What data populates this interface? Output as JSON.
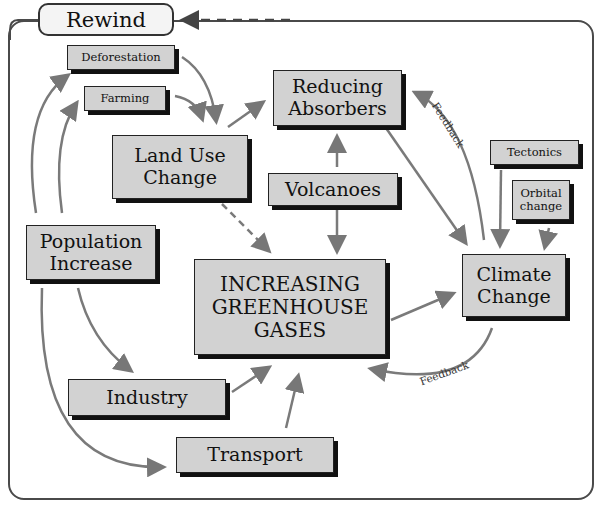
{
  "rewind": {
    "label": "Rewind"
  },
  "nodes": {
    "deforestation": "Deforestation",
    "farming": "Farming",
    "land_use_change": "Land Use\nChange",
    "reducing_absorbers": "Reducing\nAbsorbers",
    "volcanoes": "Volcanoes",
    "tectonics": "Tectonics",
    "orbital_change": "Orbital\nchange",
    "population_increase": "Population\nIncrease",
    "increasing_greenhouse_gases": "INCREASING\nGREENHOUSE\nGASES",
    "climate_change": "Climate\nChange",
    "industry": "Industry",
    "transport": "Transport"
  },
  "labels": {
    "feedback_top": "Feedback",
    "feedback_bottom": "Feedback"
  },
  "colors": {
    "node_fill": "#d2d2d2",
    "arrow": "#7a7a7a",
    "frame": "#4a4a4a"
  }
}
